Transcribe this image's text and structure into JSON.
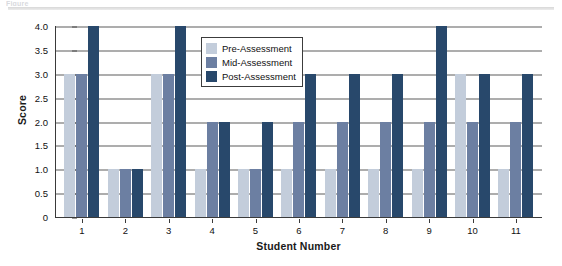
{
  "top_caption": "Figure",
  "chart_data": {
    "type": "bar",
    "title": "",
    "subtitle": "",
    "xlabel": "Student Number",
    "ylabel": "Score",
    "categories": [
      "1",
      "2",
      "3",
      "4",
      "5",
      "6",
      "7",
      "8",
      "9",
      "10",
      "11"
    ],
    "series": [
      {
        "name": "Pre-Assessment",
        "color": "#c3cddb",
        "values": [
          3,
          1,
          3,
          1,
          1,
          1,
          1,
          1,
          1,
          3,
          1
        ]
      },
      {
        "name": "Mid-Assessment",
        "color": "#6c7fa2",
        "values": [
          3,
          1,
          3,
          2,
          1,
          2,
          2,
          2,
          2,
          2,
          2
        ]
      },
      {
        "name": "Post-Assessment",
        "color": "#28486b",
        "values": [
          4,
          1,
          4,
          2,
          2,
          3,
          3,
          3,
          4,
          3,
          3
        ]
      }
    ],
    "ylim": [
      0,
      4
    ],
    "yticks": [
      "0",
      "0.5",
      "1.0",
      "1.5",
      "2.0",
      "2.5",
      "3.0",
      "3.5",
      "4.0"
    ],
    "ytick_values": [
      0,
      0.5,
      1.0,
      1.5,
      2.0,
      2.5,
      3.0,
      3.5,
      4.0
    ],
    "grid": "horizontal",
    "legend_position": "upper-center-left",
    "legend": [
      "Pre-Assessment",
      "Mid-Assessment",
      "Post-Assessment"
    ]
  }
}
